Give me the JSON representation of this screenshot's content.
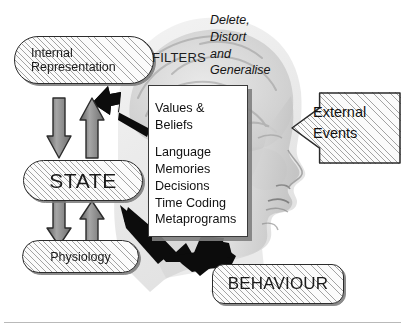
{
  "diagram": {
    "nodes": {
      "internal_representation": {
        "line1": "Internal",
        "line2": "Representation"
      },
      "state": {
        "label": "STATE"
      },
      "physiology": {
        "label": "Physiology"
      },
      "behaviour": {
        "label": "BEHAVIOUR"
      }
    },
    "filters": {
      "heading": "FILTERS",
      "processes": [
        "Delete,",
        "Distort",
        "and",
        "Generalise"
      ],
      "items": [
        "Values &",
        "Beliefs",
        "",
        "Language",
        "Memories",
        "Decisions",
        "Time Coding",
        "Metaprograms"
      ]
    },
    "external_events": {
      "line1": "External",
      "line2": "Events"
    },
    "icons": {
      "head_profile": "head-profile-image",
      "brain": "brain-image",
      "arrow_down_upper": "arrow-down-icon",
      "arrow_up_upper": "arrow-up-icon",
      "arrow_down_lower": "arrow-down-icon",
      "arrow_up_lower": "arrow-up-icon",
      "arrow_to_internal": "arrow-up-left-icon",
      "arrow_to_behaviour": "arrow-down-right-icon",
      "external_events_arrow": "arrow-left-block-icon"
    },
    "colors": {
      "ink": "#1a1a1a",
      "hatch_line": "#5a5a5a",
      "panel_bg": "#ffffff",
      "shadow": "#808080",
      "black_arrow": "#000000",
      "grey_arrow_fill": "#8c8c8c",
      "rule": "#b9b9b9"
    }
  }
}
